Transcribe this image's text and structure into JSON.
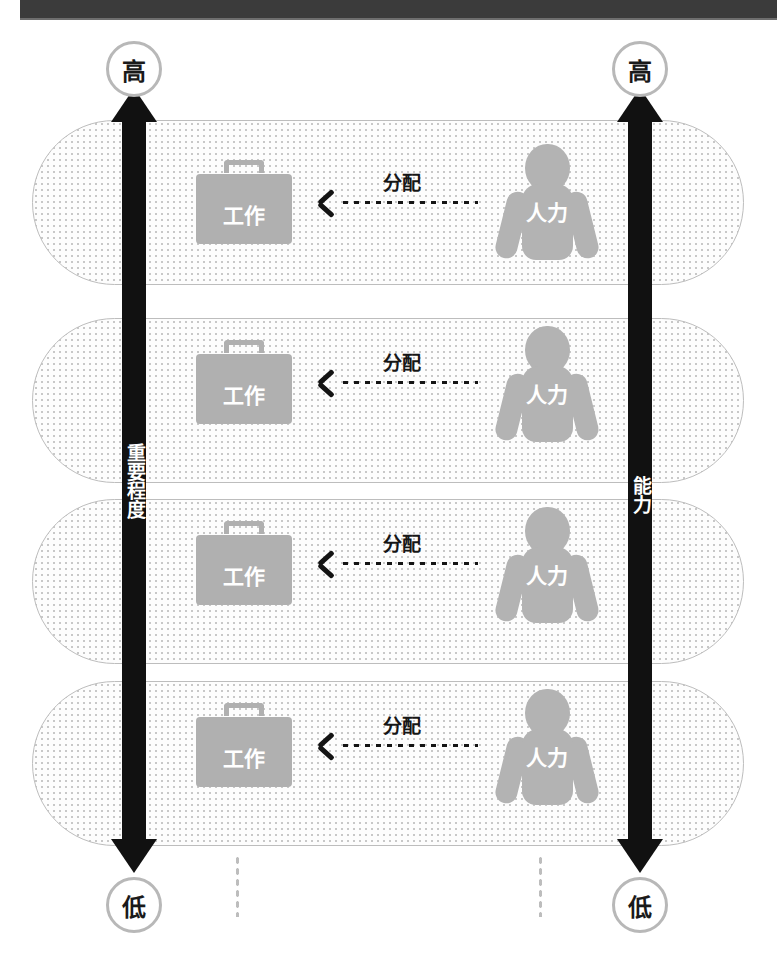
{
  "diagram": {
    "title_band": "",
    "left_axis": {
      "label": "重要程度",
      "top_cap": "高",
      "bottom_cap": "低"
    },
    "right_axis": {
      "label": "能力",
      "top_cap": "高",
      "bottom_cap": "低"
    },
    "rows": [
      {
        "work_label": "工作",
        "arrow_label": "分配",
        "people_label": "人力"
      },
      {
        "work_label": "工作",
        "arrow_label": "分配",
        "people_label": "人力"
      },
      {
        "work_label": "工作",
        "arrow_label": "分配",
        "people_label": "人力"
      },
      {
        "work_label": "工作",
        "arrow_label": "分配",
        "people_label": "人力"
      }
    ],
    "continuation": {
      "left": "⋮",
      "right": "⋮"
    },
    "colors": {
      "arrow_black": "#111111",
      "band_dark": "#3b3b3b",
      "icon_gray": "#b0b0b0",
      "pill_border": "#bdbdbd",
      "pill_dots": "#c8c8c8",
      "cap_border": "#b8b8b8"
    }
  }
}
